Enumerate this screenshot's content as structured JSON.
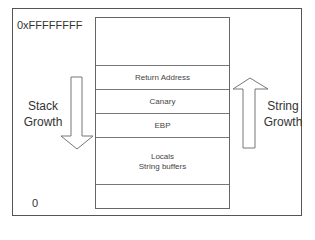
{
  "diagram": {
    "address_high": "0xFFFFFFFF",
    "address_low": "0",
    "stack_rows": [
      {
        "label": ""
      },
      {
        "label": "Return Address"
      },
      {
        "label": "Canary"
      },
      {
        "label": "EBP"
      },
      {
        "label": "Locals",
        "label2": "String buffers"
      },
      {
        "label": ""
      }
    ],
    "left_arrow": {
      "direction": "down",
      "line1": "Stack",
      "line2": "Growth"
    },
    "right_arrow": {
      "direction": "up",
      "line1": "String",
      "line2": "Growth"
    },
    "colors": {
      "line": "#666666",
      "text": "#333333",
      "background": "#ffffff"
    }
  }
}
